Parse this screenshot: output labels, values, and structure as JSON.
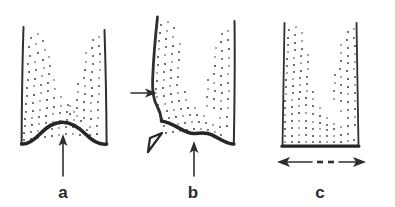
{
  "figure": {
    "background_color": "#ffffff",
    "ink_color": "#2f2f2f",
    "grain_color": "#3a3a3a",
    "width": 395,
    "height": 207
  },
  "panels": [
    {
      "id": "a",
      "label": "a",
      "label_x": 63,
      "label_y": 198,
      "description": "Vessel with curved (domed) base, granular fill along walls, single upward arrow beneath the dome",
      "base_type": "domed-arch",
      "wall_type": "straight-flared",
      "annotations": [
        {
          "name": "up-arrow",
          "direction": "up",
          "points_at": "base-apex"
        }
      ]
    },
    {
      "id": "b",
      "label": "b",
      "label_x": 193,
      "label_y": 198,
      "description": "Vessel with asymmetric curved base and deformed left wall, horizontal arrow pushing the left wall inward, open wedge at the lower-left junction, upward arrow beneath the base",
      "base_type": "domed-arch-tilted",
      "wall_type": "deformed-left",
      "annotations": [
        {
          "name": "side-arrow",
          "direction": "right",
          "points_at": "left-wall"
        },
        {
          "name": "wedge",
          "direction": "up-right",
          "points_at": "wall-base-junction"
        },
        {
          "name": "up-arrow",
          "direction": "up",
          "points_at": "base-apex"
        }
      ]
    },
    {
      "id": "c",
      "label": "c",
      "label_x": 320,
      "label_y": 198,
      "description": "Vessel with flat base, granular material forming a U-shaped distribution, horizontal double-headed arrow with dashed midsection beneath",
      "base_type": "flat",
      "wall_type": "straight-flared",
      "annotations": [
        {
          "name": "double-arrow",
          "direction": "horizontal",
          "points_at": "base-width",
          "dashed_middle": true
        }
      ]
    }
  ]
}
